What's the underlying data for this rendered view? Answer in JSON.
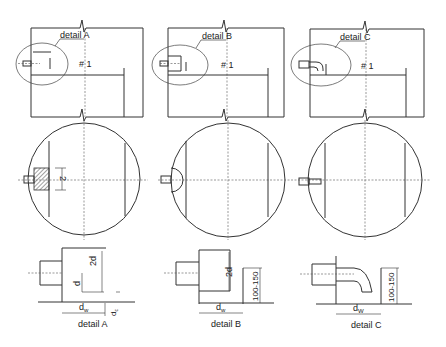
{
  "diagram": {
    "type": "technical-drawing",
    "columns": [
      {
        "id": "A",
        "callout_label": "detail A",
        "tank_label": "# 1",
        "plan_annotation": "2",
        "detail": {
          "title": "detail A",
          "dims": {
            "height_2d": "2d",
            "height_d": "d",
            "width": "dw",
            "width_main": "d",
            "width_sub": "w",
            "clearance": "dc",
            "clearance_main": "d",
            "clearance_sub": "c"
          }
        }
      },
      {
        "id": "B",
        "callout_label": "detail B",
        "tank_label": "# 1",
        "detail": {
          "title": "detail B",
          "dims": {
            "height_2d": "2d",
            "height_range": "100-150",
            "width_main": "d",
            "width_sub": "w"
          }
        }
      },
      {
        "id": "C",
        "callout_label": "detail C",
        "tank_label": "# 1",
        "detail": {
          "title": "detail C",
          "dims": {
            "height_range": "100-150",
            "width_main": "d",
            "width_sub": "W"
          }
        }
      }
    ]
  }
}
